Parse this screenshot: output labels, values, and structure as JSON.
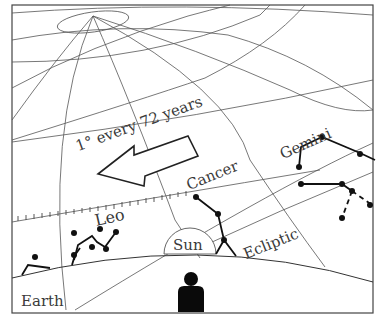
{
  "diagram": {
    "labels": {
      "rate": "1° every 72 years",
      "gemini": "Gemini",
      "cancer": "Cancer",
      "leo": "Leo",
      "sun": "Sun",
      "ecliptic": "Ecliptic",
      "earth": "Earth"
    },
    "constellations": [
      {
        "name": "Gemini",
        "stars": 8
      },
      {
        "name": "Cancer",
        "stars": 4
      },
      {
        "name": "Leo",
        "stars": 7
      },
      {
        "name": "unlabeled-left",
        "stars": 1
      }
    ],
    "arrow_direction": "left",
    "colors": {
      "background": "#ffffff",
      "lines": "#555555",
      "ink": "#111111",
      "text": "#3a3a3a"
    }
  }
}
